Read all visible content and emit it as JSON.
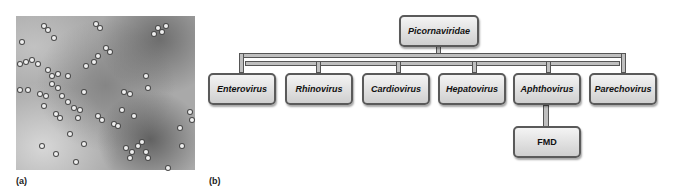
{
  "panels": {
    "a": {
      "label": "(a)",
      "description": "electron micrograph of picornavirus particles"
    },
    "b": {
      "label": "(b)"
    }
  },
  "diagram": {
    "root": {
      "label": "Picornaviridae"
    },
    "genera": [
      {
        "label": "Enterovirus"
      },
      {
        "label": "Rhinovirus"
      },
      {
        "label": "Cardiovirus"
      },
      {
        "label": "Hepatovirus"
      },
      {
        "label": "Aphthovirus"
      },
      {
        "label": "Parechovirus"
      }
    ],
    "child": {
      "parent": "Aphthovirus",
      "label": "FMD"
    }
  }
}
